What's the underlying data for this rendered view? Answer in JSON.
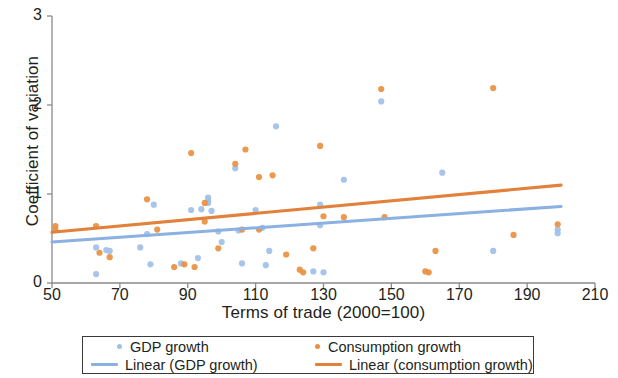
{
  "chart_data": {
    "type": "scatter",
    "title": "",
    "xlabel": "Terms of trade (2000=100)",
    "ylabel": "Coefficient of variation",
    "xlim": [
      50,
      210
    ],
    "ylim": [
      0,
      3
    ],
    "xticks": [
      50,
      70,
      90,
      110,
      130,
      150,
      170,
      190,
      210
    ],
    "yticks": [
      0,
      1,
      2,
      3
    ],
    "grid": false,
    "legend_position": "below-axes",
    "colors": {
      "gdp_growth": "#9FC0E8",
      "consumption_growth": "#E8903F",
      "trend_gdp_growth": "#8BB0E2",
      "trend_consumption_growth": "#E1813A",
      "axis": "#8a8a8a",
      "text": "#231f20",
      "legend_border": "#3a3a3a",
      "background": "#ffffff"
    },
    "series": [
      {
        "name": "GDP growth",
        "type": "scatter",
        "color": "#9FC0E8",
        "points": [
          [
            63,
            0.4
          ],
          [
            63,
            0.1
          ],
          [
            66,
            0.37
          ],
          [
            67,
            0.36
          ],
          [
            76,
            0.4
          ],
          [
            78,
            0.55
          ],
          [
            79,
            0.21
          ],
          [
            80,
            0.88
          ],
          [
            88,
            0.22
          ],
          [
            91,
            0.82
          ],
          [
            93,
            0.28
          ],
          [
            94,
            0.83
          ],
          [
            96,
            0.96
          ],
          [
            96,
            0.92
          ],
          [
            96,
            0.9
          ],
          [
            97,
            0.81
          ],
          [
            99,
            0.58
          ],
          [
            100,
            0.46
          ],
          [
            104,
            1.29
          ],
          [
            105,
            0.59
          ],
          [
            106,
            0.22
          ],
          [
            110,
            0.82
          ],
          [
            112,
            0.62
          ],
          [
            113,
            0.2
          ],
          [
            114,
            0.36
          ],
          [
            116,
            1.76
          ],
          [
            127,
            0.13
          ],
          [
            129,
            0.88
          ],
          [
            129,
            0.65
          ],
          [
            130,
            0.12
          ],
          [
            136,
            1.16
          ],
          [
            147,
            2.04
          ],
          [
            165,
            1.24
          ],
          [
            180,
            0.36
          ],
          [
            199,
            0.6
          ],
          [
            199,
            0.56
          ]
        ]
      },
      {
        "name": "Consumption growth",
        "type": "scatter",
        "color": "#E8903F",
        "points": [
          [
            51,
            0.64
          ],
          [
            51,
            0.6
          ],
          [
            63,
            0.64
          ],
          [
            64,
            0.34
          ],
          [
            67,
            0.29
          ],
          [
            78,
            0.94
          ],
          [
            81,
            0.6
          ],
          [
            86,
            0.18
          ],
          [
            89,
            0.21
          ],
          [
            91,
            1.46
          ],
          [
            92,
            0.18
          ],
          [
            95,
            0.9
          ],
          [
            95,
            0.69
          ],
          [
            99,
            0.39
          ],
          [
            104,
            1.34
          ],
          [
            106,
            0.6
          ],
          [
            107,
            1.5
          ],
          [
            111,
            1.19
          ],
          [
            111,
            0.6
          ],
          [
            115,
            1.21
          ],
          [
            119,
            0.32
          ],
          [
            123,
            0.15
          ],
          [
            124,
            0.12
          ],
          [
            127,
            0.39
          ],
          [
            129,
            1.54
          ],
          [
            130,
            0.75
          ],
          [
            136,
            0.74
          ],
          [
            147,
            2.18
          ],
          [
            148,
            0.74
          ],
          [
            160,
            0.13
          ],
          [
            161,
            0.12
          ],
          [
            163,
            0.36
          ],
          [
            180,
            2.19
          ],
          [
            186,
            0.54
          ],
          [
            199,
            0.66
          ]
        ]
      },
      {
        "name": "Linear (GDP growth)",
        "type": "line",
        "color": "#8BB0E2",
        "endpoints": [
          [
            50,
            0.46
          ],
          [
            200,
            0.86
          ]
        ]
      },
      {
        "name": "Linear (consumption growth)",
        "type": "line",
        "color": "#E1813A",
        "endpoints": [
          [
            50,
            0.57
          ],
          [
            200,
            1.1
          ]
        ]
      }
    ]
  },
  "legend": {
    "entries": [
      {
        "label": "GDP growth",
        "marker": "dot",
        "color": "#9FC0E8"
      },
      {
        "label": "Consumption growth",
        "marker": "dot",
        "color": "#E8903F"
      },
      {
        "label": "Linear (GDP growth)",
        "marker": "line",
        "color": "#8BB0E2"
      },
      {
        "label": "Linear (consumption growth)",
        "marker": "line",
        "color": "#E1813A"
      }
    ]
  },
  "axes": {
    "x_title": "Terms of trade (2000=100)",
    "y_title": "Coefficient of variation",
    "x_tick_labels": [
      "50",
      "70",
      "90",
      "110",
      "130",
      "150",
      "170",
      "190",
      "210"
    ],
    "y_tick_labels": [
      "0",
      "1",
      "2",
      "3"
    ]
  }
}
